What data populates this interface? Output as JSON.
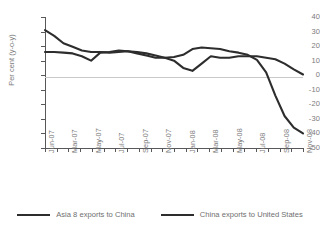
{
  "chart_data": {
    "type": "line",
    "title": "",
    "subtitle": "",
    "xlabel": "",
    "ylabel": "Per cent (y-o-y)",
    "ylim": [
      -50,
      40
    ],
    "ytick_values": [
      40,
      30,
      20,
      10,
      0,
      -10,
      -20,
      -30,
      -40,
      -50
    ],
    "ytick_labels": [
      "40",
      "30",
      "20",
      "10",
      "0",
      "-10",
      "-20",
      "-30",
      "-40",
      "-50"
    ],
    "grid": false,
    "zero_line": true,
    "legend_position": "bottom",
    "x": [
      "Jun-07",
      "Jul-07",
      "Aug-07",
      "Sep-07",
      "Oct-07",
      "Nov-07",
      "Dec-07",
      "Jan-08",
      "Feb-08",
      "Mar-08",
      "Apr-08",
      "May-08",
      "Jun-08",
      "Jul-08",
      "Aug-08",
      "Sep-08",
      "Oct-08",
      "Nov-08",
      "Dec-08",
      "Jan-09",
      "Feb-09",
      "Mar-09",
      "Apr-09",
      "May-09",
      "Jun-09",
      "Jul-09",
      "Aug-09",
      "Sep-09",
      "Oct-09"
    ],
    "xtick_labels": [
      "Jun-07",
      "Mar-07",
      "May-07",
      "Jul-07",
      "Sep-07",
      "Nov-07",
      "Jan-08",
      "Mar-08",
      "May-08",
      "Jul-08",
      "Sep-08",
      "Nov-08"
    ],
    "series": [
      {
        "name": "Asia 8 exports to China",
        "color": "#2d2d2d",
        "values": [
          16,
          16,
          15.5,
          15,
          13,
          10,
          15.5,
          16,
          17,
          16.5,
          15,
          13.5,
          12,
          12,
          12.5,
          14,
          18,
          19,
          18.5,
          18,
          16.5,
          15.5,
          14,
          10.5,
          2,
          -14,
          -28,
          -36,
          -40
        ]
      },
      {
        "name": "China exports to United States",
        "color": "#2d2d2d",
        "values": [
          31,
          27,
          22,
          19.5,
          17,
          16,
          16,
          15.5,
          16,
          16.5,
          16,
          15,
          13.5,
          12,
          10,
          5,
          3,
          8,
          13,
          12,
          12,
          13,
          13,
          13,
          12,
          11,
          8,
          4,
          0.5
        ]
      }
    ]
  },
  "legend": {
    "items": [
      {
        "label": "Asia 8 exports to China"
      },
      {
        "label": "China exports to United States"
      }
    ]
  }
}
